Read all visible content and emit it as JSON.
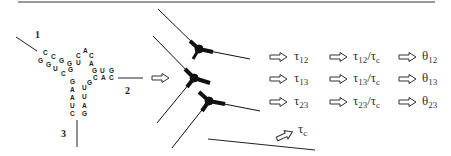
{
  "figure": {
    "arm_labels": [
      "1",
      "2",
      "3"
    ],
    "rna_sequence": {
      "arm1_top": [
        "C",
        "C",
        "G",
        "G",
        "U"
      ],
      "arm1_bottom": [
        "G",
        "G",
        "U",
        "C",
        "G"
      ],
      "hairpin_loop": [
        "C",
        "A",
        "C"
      ],
      "arm2_top": [
        "G",
        "U",
        "G"
      ],
      "arm2_bottom": [
        "C",
        "A",
        "C"
      ],
      "junction": [
        "A",
        "G"
      ],
      "arm3_left": [
        "G",
        "A",
        "A",
        "U",
        "C"
      ],
      "arm3_right": [
        "U",
        "U",
        "A",
        "G"
      ]
    },
    "rows": [
      {
        "tau": "τ",
        "tau_sub": "12",
        "ratio": "τ",
        "ratio_sub": "12",
        "ratio_den": "τ",
        "ratio_den_sub": "c",
        "theta": "θ",
        "theta_sub": "12"
      },
      {
        "tau": "τ",
        "tau_sub": "13",
        "ratio": "τ",
        "ratio_sub": "13",
        "ratio_den": "τ",
        "ratio_den_sub": "c",
        "theta": "θ",
        "theta_sub": "13"
      },
      {
        "tau": "τ",
        "tau_sub": "23",
        "ratio": "τ",
        "ratio_sub": "23",
        "ratio_den": "τ",
        "ratio_den_sub": "c",
        "theta": "θ",
        "theta_sub": "23"
      }
    ],
    "tau_c": {
      "symbol": "τ",
      "sub": "c"
    },
    "colors": {
      "line": "#1a1a1a",
      "top_rule": "#9a9a9a",
      "text": "#222222"
    }
  }
}
